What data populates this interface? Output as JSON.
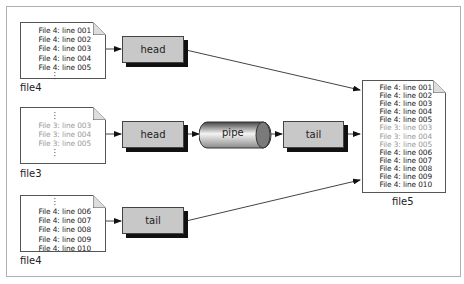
{
  "diagram": {
    "sources": [
      {
        "id": "doc1",
        "label": "file4",
        "top_dots": false,
        "bottom_dots": true,
        "lines": [
          {
            "text": "File 4: line 001",
            "dim": false
          },
          {
            "text": "File 4: line 002",
            "dim": false
          },
          {
            "text": "File 4: line 003",
            "dim": false
          },
          {
            "text": "File 4: line 004",
            "dim": false
          },
          {
            "text": "File 4: line 005",
            "dim": false
          }
        ]
      },
      {
        "id": "doc2",
        "label": "file3",
        "top_dots": true,
        "bottom_dots": true,
        "lines": [
          {
            "text": "File 3: line 003",
            "dim": true
          },
          {
            "text": "File 3: line 004",
            "dim": true
          },
          {
            "text": "File 3: line 005",
            "dim": true
          }
        ]
      },
      {
        "id": "doc3",
        "label": "file4",
        "top_dots": true,
        "bottom_dots": false,
        "lines": [
          {
            "text": "File 4: line 006",
            "dim": false
          },
          {
            "text": "File 4: line 007",
            "dim": false
          },
          {
            "text": "File 4: line 008",
            "dim": false
          },
          {
            "text": "File 4: line 009",
            "dim": false
          },
          {
            "text": "File 4: line 010",
            "dim": false
          }
        ]
      }
    ],
    "processes": {
      "head1": "head",
      "head2": "head",
      "pipe": "pipe",
      "tail2": "tail",
      "tail3": "tail"
    },
    "output": {
      "label": "file5",
      "lines": [
        {
          "text": "File 4: line 001",
          "dim": false
        },
        {
          "text": "File 4: line 002",
          "dim": false
        },
        {
          "text": "File 4: line 003",
          "dim": false
        },
        {
          "text": "File 4: line 004",
          "dim": false
        },
        {
          "text": "File 4: line 005",
          "dim": false
        },
        {
          "text": "File 3: line 003",
          "dim": true
        },
        {
          "text": "File 3: line 004",
          "dim": true
        },
        {
          "text": "File 3: line 005",
          "dim": true
        },
        {
          "text": "File 4: line 006",
          "dim": false
        },
        {
          "text": "File 4: line 007",
          "dim": false
        },
        {
          "text": "File 4: line 008",
          "dim": false
        },
        {
          "text": "File 4: line 009",
          "dim": false
        },
        {
          "text": "File 4: line 010",
          "dim": false
        }
      ]
    },
    "colors": {
      "process_fill": "#c8c8c8",
      "shadow": "#111111",
      "dim_text": "#999999",
      "text": "#222222"
    }
  }
}
